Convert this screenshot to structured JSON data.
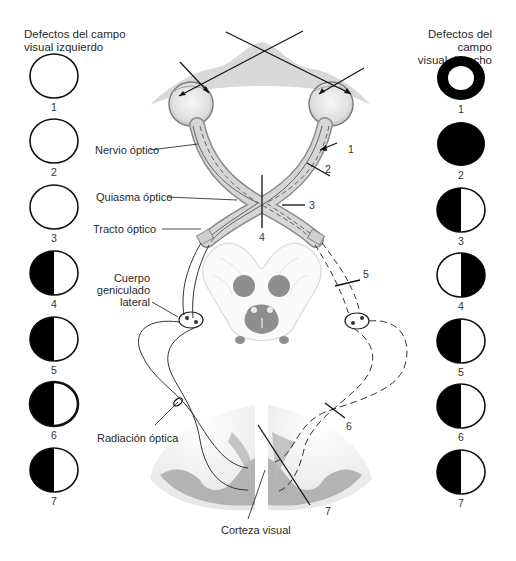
{
  "headers": {
    "left": [
      "Defectos del campo",
      "visual izquierdo"
    ],
    "right": [
      "Defectos del campo",
      "visual derecho"
    ]
  },
  "left_fields": [
    {
      "number": "1",
      "pattern": "none"
    },
    {
      "number": "2",
      "pattern": "none"
    },
    {
      "number": "3",
      "pattern": "none"
    },
    {
      "number": "4",
      "pattern": "left-half-black"
    },
    {
      "number": "5",
      "pattern": "left-half-black"
    },
    {
      "number": "6",
      "pattern": "left-half-black-macular-sparing"
    },
    {
      "number": "7",
      "pattern": "left-half-black"
    }
  ],
  "right_fields": [
    {
      "number": "1",
      "pattern": "ring-black-peripheral-loss"
    },
    {
      "number": "2",
      "pattern": "full-black"
    },
    {
      "number": "3",
      "pattern": "left-half-black"
    },
    {
      "number": "4",
      "pattern": "right-half-black"
    },
    {
      "number": "5",
      "pattern": "left-half-black"
    },
    {
      "number": "6",
      "pattern": "left-half-black"
    },
    {
      "number": "7",
      "pattern": "left-half-black"
    }
  ],
  "labels": {
    "nervio_optico": "Nervio óptico",
    "quiasma_optico": "Quiasma óptico",
    "tracto_optico": "Tracto óptico",
    "cuerpo_geniculado": [
      "Cuerpo",
      "geniculado",
      "lateral"
    ],
    "radiacion_optica": "Radiación óptica",
    "corteza_visual": "Corteza visual"
  },
  "lesion_numbers": [
    "1",
    "2",
    "3",
    "4",
    "5",
    "6",
    "7"
  ],
  "colors": {
    "black": "#000000",
    "nerve_fill": "#d4d4d4",
    "nerve_outline": "#8a8a8a",
    "brainstem_outline": "#d8d8d8",
    "nuclei": "#8c8c8c",
    "cortex_dark": "#9a9a9a",
    "cortex_light": "#c8c8c8",
    "line": "#2a2a2a"
  }
}
